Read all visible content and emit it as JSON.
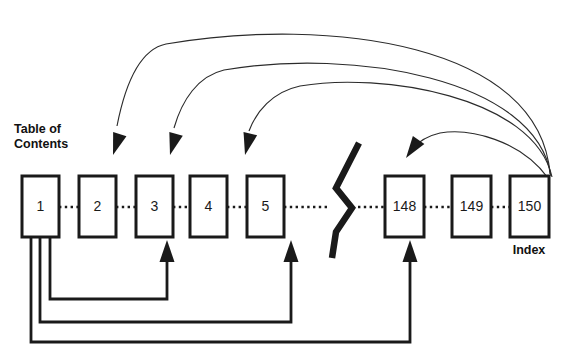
{
  "diagram": {
    "title_visible": false,
    "labels": {
      "table_of_contents_line1": "Table of",
      "table_of_contents_line2": "Contents",
      "index": "Index"
    },
    "pages": [
      {
        "number": "1",
        "x": 22,
        "y": 176,
        "w": 37,
        "h": 61
      },
      {
        "number": "2",
        "x": 79,
        "y": 176,
        "w": 37,
        "h": 61
      },
      {
        "number": "3",
        "x": 136,
        "y": 176,
        "w": 37,
        "h": 61
      },
      {
        "number": "4",
        "x": 190,
        "y": 176,
        "w": 37,
        "h": 61
      },
      {
        "number": "5",
        "x": 247,
        "y": 176,
        "w": 37,
        "h": 61
      },
      {
        "number": "148",
        "x": 385,
        "y": 176,
        "w": 39,
        "h": 61
      },
      {
        "number": "149",
        "x": 452,
        "y": 176,
        "w": 39,
        "h": 61
      },
      {
        "number": "150",
        "x": 510,
        "y": 176,
        "w": 39,
        "h": 61
      }
    ],
    "connectors_dotted": [
      {
        "x1": 59,
        "x2": 79,
        "y": 207
      },
      {
        "x1": 116,
        "x2": 136,
        "y": 207
      },
      {
        "x1": 173,
        "x2": 190,
        "y": 207
      },
      {
        "x1": 227,
        "x2": 247,
        "y": 207
      },
      {
        "x1": 284,
        "x2": 330,
        "y": 207
      },
      {
        "x1": 358,
        "x2": 385,
        "y": 207
      },
      {
        "x1": 424,
        "x2": 452,
        "y": 207
      },
      {
        "x1": 491,
        "x2": 510,
        "y": 207
      }
    ],
    "break_symbol": {
      "name": "page-break-zigzag",
      "points": "359,143 336,188 352,208 336,232 332,258"
    },
    "index_arcs": [
      {
        "id": "arc-index-to-page2",
        "from": "150",
        "to": "2",
        "path": "M 550,174 C 540,44 330,16 166,44 C 142,49 126,80 117,126",
        "head_x": 113,
        "head_y": 155,
        "head_angle": 108
      },
      {
        "id": "arc-index-to-page3",
        "from": "150",
        "to": "3",
        "path": "M 551,176 C 536,78 352,48 224,70 C 198,76 182,100 174,128",
        "head_x": 170,
        "head_y": 155,
        "head_angle": 106
      },
      {
        "id": "arc-index-to-page5",
        "from": "150",
        "to": "5",
        "path": "M 552,177 C 534,96 380,72 300,86 C 272,92 256,112 249,131",
        "head_x": 245,
        "head_y": 155,
        "head_angle": 104
      },
      {
        "id": "arc-index-to-page148",
        "from": "150",
        "to": "148",
        "path": "M 548,178 C 520,140 470,128 440,133 C 427,136 418,142 412,149",
        "head_x": 406,
        "head_y": 158,
        "head_angle": 125
      }
    ],
    "toc_arrows": [
      {
        "id": "toc-to-page3",
        "from": "1",
        "to": "3",
        "path": "M 50,238 L 50,299 L 167,299 L 167,258",
        "head_x": 167,
        "head_y": 240
      },
      {
        "id": "toc-to-page5",
        "from": "1",
        "to": "5",
        "path": "M 40,238 L 40,322 L 291,322 L 291,258",
        "head_x": 291,
        "head_y": 240
      },
      {
        "id": "toc-to-page148",
        "from": "1",
        "to": "148",
        "path": "M 31,238 L 31,342 L 410,342 L 410,258",
        "head_x": 410,
        "head_y": 240
      }
    ],
    "colors": {
      "ink": "#1a1a1a",
      "arc_stroke": "#2b2b2b",
      "background": "#ffffff"
    }
  }
}
